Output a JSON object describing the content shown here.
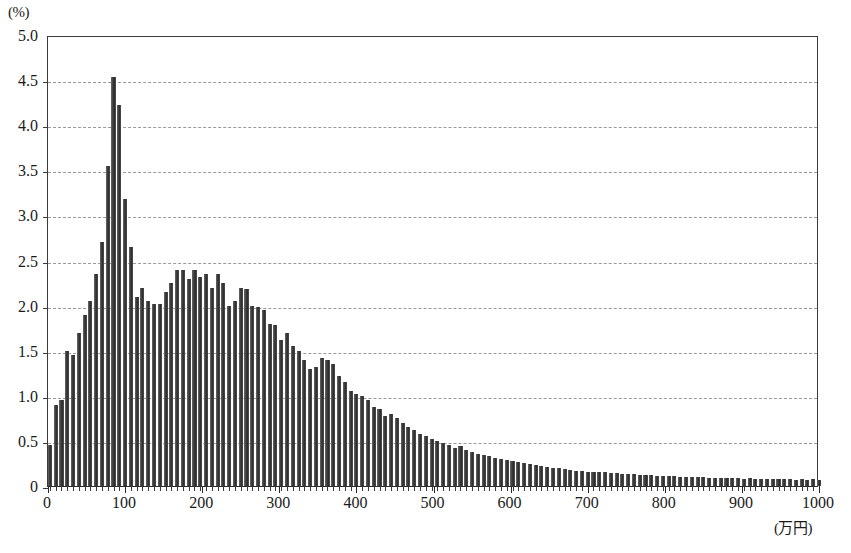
{
  "chart_data": {
    "type": "bar",
    "title": "",
    "subtitle": "",
    "xlabel": "(万円)",
    "ylabel": "(%)",
    "xlim": [
      0,
      1000
    ],
    "ylim": [
      0,
      5.0
    ],
    "grid": true,
    "legend": null,
    "bin_width": 10,
    "y_ticks": [
      "0",
      "0.5",
      "1.0",
      "1.5",
      "2.0",
      "2.5",
      "3.0",
      "3.5",
      "4.0",
      "4.5",
      "5.0"
    ],
    "y_tick_values": [
      0,
      0.5,
      1.0,
      1.5,
      2.0,
      2.5,
      3.0,
      3.5,
      4.0,
      4.5,
      5.0
    ],
    "x_ticks": [
      "0",
      "100",
      "200",
      "300",
      "400",
      "500",
      "600",
      "700",
      "800",
      "900",
      "1000"
    ],
    "x_tick_values": [
      0,
      100,
      200,
      300,
      400,
      500,
      600,
      700,
      800,
      900,
      1000
    ],
    "bar_color": "#3c3c3c",
    "grid_color": "#9a9a9a",
    "axis_color": "#2a2a2a",
    "x": [
      2.5,
      10,
      17.5,
      25,
      32.5,
      40,
      47.5,
      55,
      62.5,
      70,
      77.5,
      85,
      92.5,
      100,
      107.5,
      115,
      122.5,
      130,
      137.5,
      145,
      152.5,
      160,
      167.5,
      175,
      182.5,
      190,
      197.5,
      205,
      212.5,
      220,
      227.5,
      235,
      242.5,
      250,
      257.5,
      265,
      272.5,
      280,
      287.5,
      295,
      302.5,
      310,
      317.5,
      325,
      332.5,
      340,
      347.5,
      355,
      362.5,
      370,
      377.5,
      385,
      392.5,
      400,
      407.5,
      415,
      422.5,
      430,
      437.5,
      445,
      452.5,
      460,
      467.5,
      475,
      482.5,
      490,
      497.5,
      505,
      512.5,
      520,
      527.5,
      535,
      542.5,
      550,
      557.5,
      565,
      572.5,
      580,
      587.5,
      595,
      602.5,
      610,
      617.5,
      625,
      632.5,
      640,
      647.5,
      655,
      662.5,
      670,
      677.5,
      685,
      692.5,
      700,
      707.5,
      715,
      722.5,
      730,
      737.5,
      745,
      752.5,
      760,
      767.5,
      775,
      782.5,
      790,
      797.5,
      805,
      812.5,
      820,
      827.5,
      835,
      842.5,
      850,
      857.5,
      865,
      872.5,
      880,
      887.5,
      895,
      902.5,
      910,
      917.5,
      925,
      932.5,
      940,
      947.5,
      955,
      962.5,
      970,
      977.5,
      985,
      992.5,
      1000
    ],
    "values": [
      0.45,
      0.9,
      0.95,
      1.5,
      1.45,
      1.7,
      1.9,
      2.05,
      2.35,
      2.7,
      3.55,
      4.53,
      4.22,
      3.18,
      2.65,
      2.1,
      2.2,
      2.05,
      2.02,
      2.02,
      2.15,
      2.25,
      2.4,
      2.4,
      2.3,
      2.4,
      2.32,
      2.35,
      2.2,
      2.35,
      2.25,
      2.0,
      2.05,
      2.2,
      2.18,
      2.0,
      1.98,
      1.95,
      1.8,
      1.78,
      1.62,
      1.7,
      1.55,
      1.5,
      1.4,
      1.3,
      1.32,
      1.42,
      1.4,
      1.35,
      1.22,
      1.15,
      1.05,
      1.02,
      1.0,
      0.95,
      0.88,
      0.85,
      0.78,
      0.8,
      0.75,
      0.7,
      0.65,
      0.62,
      0.58,
      0.55,
      0.52,
      0.5,
      0.48,
      0.45,
      0.42,
      0.44,
      0.4,
      0.38,
      0.36,
      0.34,
      0.33,
      0.31,
      0.3,
      0.29,
      0.28,
      0.27,
      0.25,
      0.24,
      0.23,
      0.22,
      0.21,
      0.2,
      0.2,
      0.19,
      0.18,
      0.17,
      0.17,
      0.16,
      0.16,
      0.15,
      0.15,
      0.14,
      0.14,
      0.13,
      0.13,
      0.13,
      0.12,
      0.12,
      0.12,
      0.11,
      0.11,
      0.11,
      0.11,
      0.1,
      0.1,
      0.1,
      0.1,
      0.1,
      0.09,
      0.09,
      0.09,
      0.09,
      0.09,
      0.09,
      0.08,
      0.09,
      0.08,
      0.08,
      0.08,
      0.08,
      0.08,
      0.08,
      0.08,
      0.07,
      0.08,
      0.07,
      0.08,
      0.07
    ]
  }
}
